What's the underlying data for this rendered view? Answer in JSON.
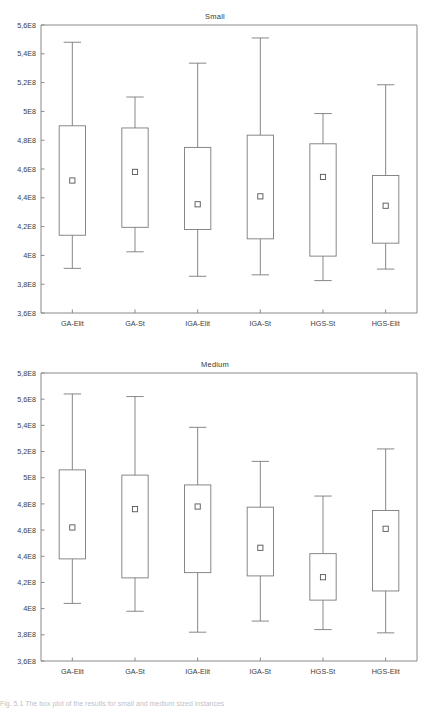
{
  "figure": {
    "caption": "Fig. 5.1 The box plot of the results for small and medium sized instances",
    "categories": [
      "GA-Elit",
      "GA-St",
      "IGA-Elit",
      "IGA-St",
      "HGS-St",
      "HGS-Elit"
    ]
  },
  "chart_data": [
    {
      "type": "box",
      "title": "Small",
      "xlabel": "",
      "ylabel": "",
      "ylim": [
        360000000,
        560000000
      ],
      "ytick_labels": [
        "3,6E8",
        "3,8E8",
        "4E8",
        "4,2E8",
        "4,4E8",
        "4,6E8",
        "4,8E8",
        "5E8",
        "5,2E8",
        "5,4E8",
        "5,6E8"
      ],
      "ytick_values": [
        360000000,
        380000000,
        400000000,
        420000000,
        440000000,
        460000000,
        480000000,
        500000000,
        520000000,
        540000000,
        560000000
      ],
      "grid": false,
      "legend": "none",
      "categories": [
        "GA-Elit",
        "GA-St",
        "IGA-Elit",
        "IGA-St",
        "HGS-St",
        "HGS-Elit"
      ],
      "boxes": [
        {
          "name": "GA-Elit",
          "whisker_low": 391000000,
          "q1": 414000000,
          "mean": 452000000,
          "q3": 490000000,
          "whisker_high": 548000000
        },
        {
          "name": "GA-St",
          "whisker_low": 402500000,
          "q1": 419500000,
          "mean": 458000000,
          "q3": 488500000,
          "whisker_high": 510000000
        },
        {
          "name": "IGA-Elit",
          "whisker_low": 385500000,
          "q1": 418000000,
          "mean": 435500000,
          "q3": 475000000,
          "whisker_high": 533500000
        },
        {
          "name": "IGA-St",
          "whisker_low": 386500000,
          "q1": 411500000,
          "mean": 441000000,
          "q3": 483500000,
          "whisker_high": 551000000
        },
        {
          "name": "HGS-St",
          "whisker_low": 382500000,
          "q1": 399500000,
          "mean": 454500000,
          "q3": 477500000,
          "whisker_high": 498500000
        },
        {
          "name": "HGS-Elit",
          "whisker_low": 390500000,
          "q1": 408500000,
          "mean": 434500000,
          "q3": 455500000,
          "whisker_high": 518500000
        }
      ]
    },
    {
      "type": "box",
      "title": "Medium",
      "xlabel": "",
      "ylabel": "",
      "ylim": [
        360000000,
        580000000
      ],
      "ytick_labels": [
        "3,6E8",
        "3,8E8",
        "4E8",
        "4,2E8",
        "4,4E8",
        "4,6E8",
        "4,8E8",
        "5E8",
        "5,2E8",
        "5,4E8",
        "5,6E8",
        "5,8E8"
      ],
      "ytick_values": [
        360000000,
        380000000,
        400000000,
        420000000,
        440000000,
        460000000,
        480000000,
        500000000,
        520000000,
        540000000,
        560000000,
        580000000
      ],
      "grid": false,
      "legend": "none",
      "categories": [
        "GA-Elit",
        "GA-St",
        "IGA-Elit",
        "IGA-St",
        "HGS-St",
        "HGS-Elit"
      ],
      "boxes": [
        {
          "name": "GA-Elit",
          "whisker_low": 404000000,
          "q1": 438000000,
          "mean": 462000000,
          "q3": 506000000,
          "whisker_high": 564000000
        },
        {
          "name": "GA-St",
          "whisker_low": 398000000,
          "q1": 423500000,
          "mean": 476000000,
          "q3": 502000000,
          "whisker_high": 562000000
        },
        {
          "name": "IGA-Elit",
          "whisker_low": 382000000,
          "q1": 427500000,
          "mean": 478000000,
          "q3": 494500000,
          "whisker_high": 538500000
        },
        {
          "name": "IGA-St",
          "whisker_low": 390500000,
          "q1": 425000000,
          "mean": 446500000,
          "q3": 477500000,
          "whisker_high": 512500000
        },
        {
          "name": "HGS-St",
          "whisker_low": 384000000,
          "q1": 406500000,
          "mean": 424000000,
          "q3": 442000000,
          "whisker_high": 486000000
        },
        {
          "name": "HGS-Elit",
          "whisker_low": 381500000,
          "q1": 413500000,
          "mean": 461000000,
          "q3": 475000000,
          "whisker_high": 522000000
        }
      ]
    }
  ]
}
